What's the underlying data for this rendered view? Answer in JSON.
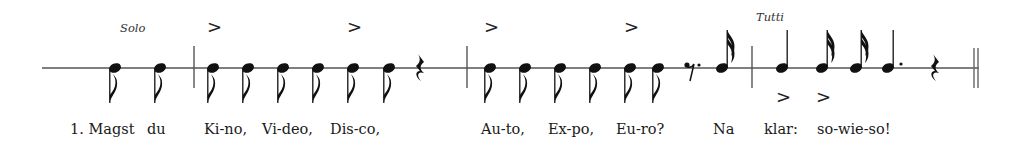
{
  "score": {
    "directions": [
      {
        "text": "Solo",
        "x": 120,
        "y": 32
      },
      {
        "text": "Tutti",
        "x": 756,
        "y": 21
      }
    ],
    "staff": {
      "y": 68,
      "x_start": 42,
      "x_end": 979,
      "color": "#555555"
    },
    "barlines": [
      194,
      467,
      752
    ],
    "final_double_bar": [
      974,
      978
    ],
    "notes": [
      {
        "x": 115,
        "type": "eighth",
        "stem": "down"
      },
      {
        "x": 160,
        "type": "eighth",
        "stem": "down"
      },
      {
        "x": 213,
        "type": "eighth",
        "stem": "down",
        "accent": "above"
      },
      {
        "x": 248,
        "type": "eighth",
        "stem": "down"
      },
      {
        "x": 283,
        "type": "eighth",
        "stem": "down"
      },
      {
        "x": 318,
        "type": "eighth",
        "stem": "down"
      },
      {
        "x": 353,
        "type": "eighth",
        "stem": "down",
        "accent": "above"
      },
      {
        "x": 389,
        "type": "eighth",
        "stem": "down"
      },
      {
        "x": 490,
        "type": "eighth",
        "stem": "down",
        "accent": "above"
      },
      {
        "x": 525,
        "type": "eighth",
        "stem": "down"
      },
      {
        "x": 560,
        "type": "eighth",
        "stem": "down"
      },
      {
        "x": 595,
        "type": "eighth",
        "stem": "down"
      },
      {
        "x": 630,
        "type": "eighth",
        "stem": "down",
        "accent": "above"
      },
      {
        "x": 658,
        "type": "eighth",
        "stem": "down"
      },
      {
        "x": 722,
        "type": "sixteenth",
        "stem": "up"
      },
      {
        "x": 782,
        "type": "quarter",
        "stem": "up",
        "accent": "below"
      },
      {
        "x": 822,
        "type": "sixteenth",
        "stem": "up",
        "accent": "below"
      },
      {
        "x": 856,
        "type": "sixteenth",
        "stem": "up"
      },
      {
        "x": 888,
        "type": "quarter",
        "stem": "up",
        "dotted": true
      }
    ],
    "rests": [
      {
        "x": 420,
        "type": "quarter"
      },
      {
        "x": 690,
        "type": "eighth",
        "dotted": true
      },
      {
        "x": 935,
        "type": "quarter"
      }
    ],
    "accent_glyph": ">",
    "lyrics": [
      {
        "text": "1. Magst",
        "x": 70
      },
      {
        "text": "du",
        "x": 147
      },
      {
        "text": "Ki-no,",
        "x": 204
      },
      {
        "text": "Vi-deo,",
        "x": 262
      },
      {
        "text": "Dis-co,",
        "x": 330
      },
      {
        "text": "Au-to,",
        "x": 481
      },
      {
        "text": "Ex-po,",
        "x": 548
      },
      {
        "text": "Eu-ro?",
        "x": 616
      },
      {
        "text": "Na",
        "x": 713
      },
      {
        "text": "klar:",
        "x": 764
      },
      {
        "text": "so-wie-so!",
        "x": 817
      }
    ],
    "lyrics_y": 134
  }
}
